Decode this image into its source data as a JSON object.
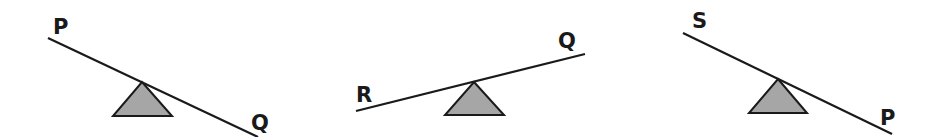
{
  "diagram": {
    "type": "seesaw-comparison",
    "colors": {
      "beam": "#1a1a1a",
      "fulcrum_fill": "#a6a6a6",
      "fulcrum_stroke": "#1a1a1a",
      "background": "#ffffff"
    },
    "seesaws": [
      {
        "id": "seesaw-1",
        "left_label": "P",
        "right_label": "Q",
        "heavier_side": "right",
        "beam": {
          "x1": 48,
          "y1": 38,
          "x2": 258,
          "y2": 137
        },
        "fulcrum": {
          "apex_x": 142,
          "apex_y": 82,
          "base_left_x": 113,
          "base_right_x": 172,
          "base_y": 116
        },
        "left_label_pos": {
          "x": 53,
          "y": 34
        },
        "right_label_pos": {
          "x": 251,
          "y": 130
        }
      },
      {
        "id": "seesaw-2",
        "left_label": "R",
        "right_label": "Q",
        "heavier_side": "left",
        "beam": {
          "x1": 356,
          "y1": 111,
          "x2": 585,
          "y2": 54
        },
        "fulcrum": {
          "apex_x": 474,
          "apex_y": 82,
          "base_left_x": 445,
          "base_right_x": 504,
          "base_y": 115
        },
        "left_label_pos": {
          "x": 356,
          "y": 102
        },
        "right_label_pos": {
          "x": 558,
          "y": 48
        }
      },
      {
        "id": "seesaw-3",
        "left_label": "S",
        "right_label": "P",
        "heavier_side": "right",
        "beam": {
          "x1": 683,
          "y1": 33,
          "x2": 892,
          "y2": 134
        },
        "fulcrum": {
          "apex_x": 778,
          "apex_y": 79,
          "base_left_x": 749,
          "base_right_x": 807,
          "base_y": 113
        },
        "left_label_pos": {
          "x": 692,
          "y": 28
        },
        "right_label_pos": {
          "x": 880,
          "y": 125
        }
      }
    ]
  }
}
